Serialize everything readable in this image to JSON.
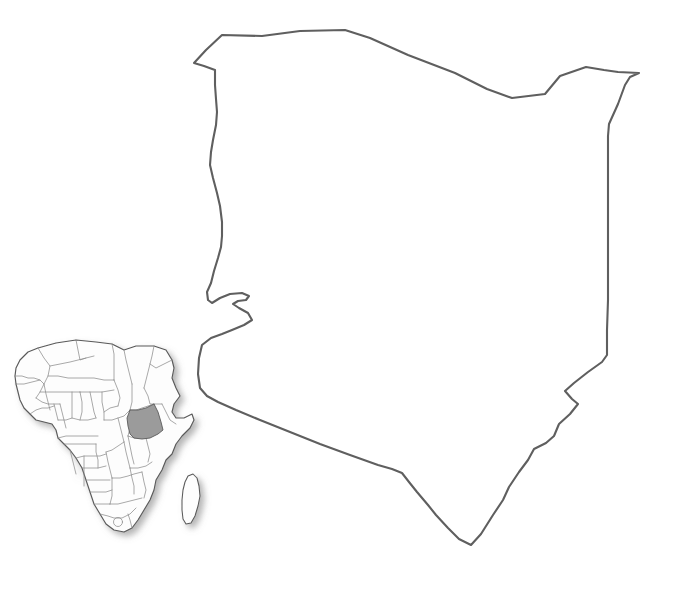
{
  "map": {
    "title": "Kenya",
    "type": "blank-outline-map",
    "background_color": "#ffffff",
    "width": 681,
    "height": 593,
    "main_shape": {
      "name": "kenya-outline",
      "fill_color": "#ffffff",
      "stroke_color": "#5f5f5f",
      "stroke_width": 2.1,
      "label": "Kenya national boundary outline"
    },
    "inset": {
      "name": "africa-locator-inset",
      "label": "Africa locator map",
      "position": "bottom-left",
      "land_fill_color": "#fdfdfd",
      "land_stroke_color": "#5a5a5a",
      "internal_border_color": "#8c8c8c",
      "highlight_country": "Kenya",
      "highlight_fill_color": "#9b9b9b",
      "island_label": "Madagascar",
      "drop_shadow": true
    }
  }
}
